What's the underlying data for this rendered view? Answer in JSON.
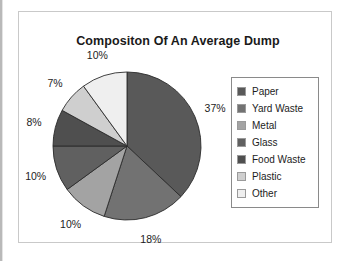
{
  "chart_data": {
    "type": "pie",
    "title": "Compositon Of An Average Dump",
    "xlabel": "",
    "ylabel": "",
    "legend_position": "right",
    "grid": false,
    "categories": [
      "Paper",
      "Yard Waste",
      "Metal",
      "Glass",
      "Food Waste",
      "Plastic",
      "Other"
    ],
    "values": [
      37,
      18,
      10,
      10,
      8,
      7,
      10
    ],
    "value_labels": [
      "37%",
      "18%",
      "10%",
      "10%",
      "8%",
      "7%",
      "10%"
    ],
    "colors": [
      "#595959",
      "#727272",
      "#a3a3a3",
      "#606060",
      "#4f4f4f",
      "#cfcfcf",
      "#efefef"
    ],
    "units": "percent",
    "start_angle_deg": 0,
    "direction": "clockwise"
  },
  "chart": {
    "title": "Compositon Of An Average Dump",
    "slices": [
      {
        "label": "Paper",
        "percent": 37,
        "display": "37%",
        "color": "#595959"
      },
      {
        "label": "Yard Waste",
        "percent": 18,
        "display": "18%",
        "color": "#727272"
      },
      {
        "label": "Metal",
        "percent": 10,
        "display": "10%",
        "color": "#a3a3a3"
      },
      {
        "label": "Glass",
        "percent": 10,
        "display": "10%",
        "color": "#606060"
      },
      {
        "label": "Food Waste",
        "percent": 8,
        "display": "8%",
        "color": "#4f4f4f"
      },
      {
        "label": "Plastic",
        "percent": 7,
        "display": "7%",
        "color": "#cfcfcf"
      },
      {
        "label": "Other",
        "percent": 10,
        "display": "10%",
        "color": "#efefef"
      }
    ]
  },
  "legend": {
    "items": [
      {
        "label": "Paper",
        "color": "#595959"
      },
      {
        "label": "Yard Waste",
        "color": "#727272"
      },
      {
        "label": "Metal",
        "color": "#a3a3a3"
      },
      {
        "label": "Glass",
        "color": "#606060"
      },
      {
        "label": "Food Waste",
        "color": "#4f4f4f"
      },
      {
        "label": "Plastic",
        "color": "#cfcfcf"
      },
      {
        "label": "Other",
        "color": "#efefef"
      }
    ]
  }
}
